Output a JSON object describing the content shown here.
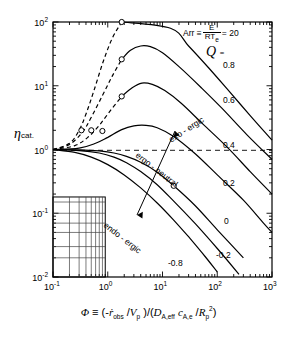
{
  "chart_data": {
    "type": "line",
    "title": "",
    "xlabel": "Φ ≡ (-ṙ_obs /V_p )/(D_A,eff c_A,e /R_p²)",
    "ylabel": "η_cat.",
    "xlim": [
      0.1,
      1000
    ],
    "ylim": [
      0.01,
      100
    ],
    "xscale": "log",
    "yscale": "log",
    "grid": false,
    "xticks": [
      "10⁻¹",
      "10⁰",
      "10¹",
      "10²",
      "10³"
    ],
    "xtick_values": [
      0.1,
      1,
      10,
      100,
      1000
    ],
    "yticks": [
      "10²",
      "10¹",
      "10⁰",
      "10⁻¹",
      "10⁻²"
    ],
    "ytick_values": [
      100,
      10,
      1,
      0.1,
      0.01
    ],
    "reference_line": {
      "y": 1,
      "style": "dashed",
      "label": "η = 1"
    },
    "annotations": {
      "arrhenius": "Arr ≡ E/RT_e = 20",
      "arr_prefix": "Arr",
      "arr_equiv": "≡",
      "arr_numerator": "E",
      "arr_denominator": "RT",
      "arr_den_sub": "e",
      "arr_equals": "= 20",
      "series_symbol": "⎷",
      "series_symbol_text": "Q",
      "series_equals": "=",
      "exoergic": "exo - ergic",
      "ergoneutral": "ergo - neutral",
      "endoergic": "endo - ergic"
    },
    "series": [
      {
        "name": "0.8",
        "label": "0.8",
        "peak": {
          "x": 5.0,
          "y": 140
        },
        "points": [
          [
            0.1,
            1.0
          ],
          [
            0.2,
            1.25
          ],
          [
            0.3,
            2.0
          ],
          [
            0.4,
            3.6
          ],
          [
            0.55,
            8
          ],
          [
            0.8,
            22
          ],
          [
            1.2,
            55
          ],
          [
            1.8,
            100
          ],
          [
            2.6,
            128
          ],
          [
            4.0,
            140
          ],
          [
            5.5,
            138
          ],
          [
            8,
            120
          ],
          [
            14,
            80
          ],
          [
            30,
            42
          ],
          [
            70,
            19
          ],
          [
            150,
            9
          ],
          [
            400,
            3.4
          ],
          [
            1000,
            1.4
          ]
        ],
        "dash_end_x": 1.8,
        "marker": {
          "x": 1.8,
          "y": 100
        }
      },
      {
        "name": "0.6",
        "label": "0.6",
        "peak": {
          "x": 5.0,
          "y": 42
        },
        "points": [
          [
            0.1,
            1.0
          ],
          [
            0.2,
            1.2
          ],
          [
            0.35,
            1.9
          ],
          [
            0.5,
            3.2
          ],
          [
            0.8,
            7.0
          ],
          [
            1.2,
            14
          ],
          [
            1.8,
            26
          ],
          [
            2.6,
            36
          ],
          [
            4.0,
            42
          ],
          [
            6,
            41
          ],
          [
            10,
            33
          ],
          [
            20,
            20
          ],
          [
            50,
            9.5
          ],
          [
            120,
            4.5
          ],
          [
            350,
            1.7
          ],
          [
            1000,
            0.7
          ]
        ],
        "dash_end_x": 1.8,
        "marker": {
          "x": 1.8,
          "y": 26
        }
      },
      {
        "name": "0.4",
        "label": "0.4",
        "peak": {
          "x": 5.0,
          "y": 11
        },
        "points": [
          [
            0.1,
            1.0
          ],
          [
            0.25,
            1.15
          ],
          [
            0.45,
            1.6
          ],
          [
            0.7,
            2.4
          ],
          [
            1.1,
            4.0
          ],
          [
            1.8,
            6.8
          ],
          [
            2.8,
            9.3
          ],
          [
            4.2,
            11
          ],
          [
            6.5,
            10.5
          ],
          [
            11,
            8.4
          ],
          [
            22,
            5.3
          ],
          [
            55,
            2.5
          ],
          [
            150,
            1.1
          ],
          [
            400,
            0.45
          ],
          [
            1000,
            0.2
          ]
        ],
        "dash_end_x": 1.8,
        "marker": {
          "x": 1.8,
          "y": 6.8
        }
      },
      {
        "name": "0.2",
        "label": "0.2",
        "peak": {
          "x": 5.0,
          "y": 2.4
        },
        "points": [
          [
            0.1,
            1.0
          ],
          [
            0.3,
            1.05
          ],
          [
            0.6,
            1.25
          ],
          [
            1.0,
            1.55
          ],
          [
            1.8,
            2.05
          ],
          [
            3.0,
            2.35
          ],
          [
            5.0,
            2.4
          ],
          [
            8,
            2.2
          ],
          [
            16,
            1.6
          ],
          [
            40,
            0.85
          ],
          [
            100,
            0.4
          ],
          [
            300,
            0.16
          ],
          [
            700,
            0.07
          ],
          [
            1000,
            0.05
          ]
        ],
        "dash_end_x": null,
        "marker": null
      },
      {
        "name": "0",
        "label": "0",
        "peak": null,
        "points": [
          [
            0.1,
            1.0
          ],
          [
            0.3,
            0.99
          ],
          [
            0.7,
            0.95
          ],
          [
            1.3,
            0.88
          ],
          [
            2.2,
            0.78
          ],
          [
            4,
            0.63
          ],
          [
            8,
            0.44
          ],
          [
            16,
            0.27
          ],
          [
            40,
            0.13
          ],
          [
            100,
            0.055
          ],
          [
            300,
            0.02
          ],
          [
            700,
            0.009
          ],
          [
            1000,
            0.006
          ]
        ],
        "dash_end_x": null,
        "marker": {
          "x": 16,
          "y": 0.27
        }
      },
      {
        "name": "-0.2",
        "label": "-0.2",
        "peak": null,
        "points": [
          [
            0.1,
            1.0
          ],
          [
            0.3,
            0.96
          ],
          [
            0.7,
            0.88
          ],
          [
            1.3,
            0.76
          ],
          [
            2.2,
            0.62
          ],
          [
            4,
            0.45
          ],
          [
            8,
            0.28
          ],
          [
            16,
            0.155
          ],
          [
            40,
            0.068
          ],
          [
            100,
            0.028
          ],
          [
            250,
            0.011
          ],
          [
            500,
            0.005
          ],
          [
            800,
            0.003
          ]
        ],
        "dash_end_x": null,
        "marker": null
      },
      {
        "name": "-0.8",
        "label": "-0.8",
        "peak": null,
        "points": [
          [
            0.1,
            1.0
          ],
          [
            0.25,
            0.9
          ],
          [
            0.5,
            0.76
          ],
          [
            1.0,
            0.58
          ],
          [
            2.0,
            0.4
          ],
          [
            4,
            0.25
          ],
          [
            8,
            0.145
          ],
          [
            16,
            0.078
          ],
          [
            32,
            0.04
          ],
          [
            60,
            0.021
          ],
          [
            100,
            0.012
          ],
          [
            160,
            0.006
          ],
          [
            230,
            0.003
          ]
        ],
        "dash_end_x": null,
        "marker": null
      }
    ],
    "inset_grid": {
      "x_range": [
        0.1,
        0.9
      ],
      "y_range": [
        0.01,
        0.18
      ],
      "description": "log minor grid box"
    }
  }
}
